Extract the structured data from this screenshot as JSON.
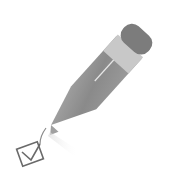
{
  "illustration": {
    "subject": "pencil-checkmark-icon",
    "colors": {
      "background": "#ffffff",
      "eraser": "#7a7a7a",
      "ferrule": "#c4c4c4",
      "body": "#8c8c8c",
      "tip": "#b0b0b0",
      "checkbox": "#6e6e6e"
    }
  }
}
